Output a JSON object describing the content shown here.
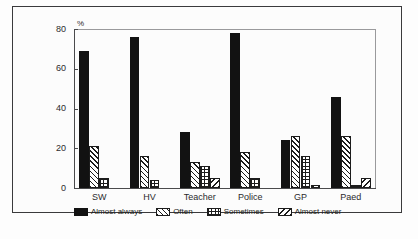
{
  "chart_data": {
    "type": "bar",
    "title": "",
    "xlabel": "",
    "ylabel": "%",
    "ylim": [
      0,
      80
    ],
    "yticks": [
      0,
      20,
      40,
      60,
      80
    ],
    "grid": false,
    "legend_position": "bottom",
    "categories": [
      "SW",
      "HV",
      "Teacher",
      "Police",
      "GP",
      "Paed"
    ],
    "series": [
      {
        "name": "Almost always",
        "pattern": "solid-black",
        "values": [
          69,
          76,
          28,
          78,
          24,
          46
        ]
      },
      {
        "name": "Often",
        "pattern": "forward-diagonal-hatch",
        "values": [
          21,
          16,
          13,
          18,
          26,
          26
        ]
      },
      {
        "name": "Sometimes",
        "pattern": "crosshatch-grid",
        "values": [
          5,
          4,
          11,
          5,
          16,
          1.5
        ]
      },
      {
        "name": "Almost never",
        "pattern": "backward-diagonal-hatch",
        "values": [
          0,
          0,
          5,
          0,
          1.5,
          5
        ]
      }
    ]
  },
  "axis": {
    "y_unit": "%",
    "y_tick_labels": [
      "80",
      "60",
      "40",
      "20",
      "0"
    ],
    "x_tick_labels": [
      "SW",
      "HV",
      "Teacher",
      "Police",
      "GP",
      "Paed"
    ]
  },
  "legend": {
    "entries": [
      {
        "label": "Almost always"
      },
      {
        "label": "Often"
      },
      {
        "label": "Sometimes"
      },
      {
        "label": "Almost never"
      }
    ]
  },
  "colors": {
    "bar_fill": "#121212",
    "outline": "#1c1c1c",
    "axis": "#4a4a4c",
    "frame": "#3a3a3c",
    "background": "#fdfdfd"
  }
}
